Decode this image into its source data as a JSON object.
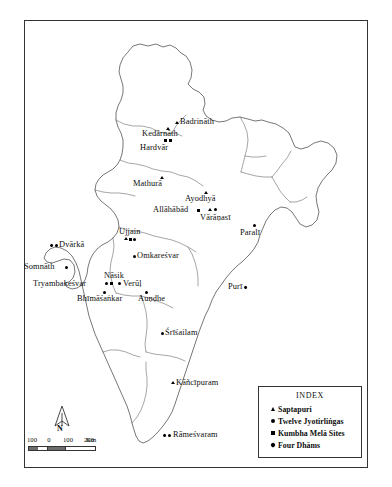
{
  "figure": {
    "kind": "thematic-map",
    "region": "India",
    "background": "#ffffff",
    "outline_color": "#4a4a4a"
  },
  "legend": {
    "title": "INDEX",
    "entries": [
      {
        "symbol": "triangle",
        "label": "Saptapuri"
      },
      {
        "symbol": "circle",
        "label": "Twelve Jyotirliṅgas"
      },
      {
        "symbol": "square",
        "label": "Kumbha Melā Sites"
      },
      {
        "symbol": "diamond",
        "label": "Four Dhāms"
      }
    ]
  },
  "compass": {
    "label": "N"
  },
  "scale": {
    "ticks": [
      "100",
      "0",
      "100",
      "200"
    ],
    "unit": "Km"
  },
  "places": [
    {
      "name": "Badrīnāth",
      "label": "Badrināth"
    },
    {
      "name": "Kedārnāth",
      "label": "Kedārnāth"
    },
    {
      "name": "Hardvār",
      "label": "Hardvār"
    },
    {
      "name": "Mathurā",
      "label": "Mathurā"
    },
    {
      "name": "Ayodhyā",
      "label": "Ayodhyā"
    },
    {
      "name": "Allāhābād",
      "label": "Allāhābād"
    },
    {
      "name": "Vārāṇasī",
      "label": "Vārāṇasī"
    },
    {
      "name": "Paralī",
      "label": "Paralī"
    },
    {
      "name": "Ujjain",
      "label": "Ujjain"
    },
    {
      "name": "Dvārkā",
      "label": "Dvārkā"
    },
    {
      "name": "Omkareśvar",
      "label": "Omkareśvar"
    },
    {
      "name": "Somnāth",
      "label": "Somnāth"
    },
    {
      "name": "Nāsik",
      "label": "Nāsik"
    },
    {
      "name": "Tryambakeśvar",
      "label": "Tryambakeśvar"
    },
    {
      "name": "Verūḷ",
      "label": "Verūḷ"
    },
    {
      "name": "Bhīmāśaṅkar",
      "label": "Bhimāśanikar"
    },
    {
      "name": "Auṇḍhe",
      "label": "Auṇḍhe"
    },
    {
      "name": "Purī",
      "label": "Puri"
    },
    {
      "name": "Śrīśailam",
      "label": "Śrīśailam"
    },
    {
      "name": "Káñcīpuram",
      "label": "Kāñcīpuram"
    },
    {
      "name": "Rāmeśvaram",
      "label": "Rāmeśvaram"
    }
  ],
  "labels": {
    "badrinath": "Badrināth",
    "kedarnath": "Kedārnāth",
    "hardvar": "Hardvār",
    "mathura": "Mathurā",
    "ayodhya": "Ayodhyā",
    "allahabad": "Allāhābād",
    "varanasi": "Vārāṇasī",
    "parali": "Paralī",
    "ujjain": "Ujjain",
    "dvarka": "Dvārkā",
    "omkaresvar": "Omkareśvar",
    "somnath": "Somnāth",
    "nasik": "Nāsik",
    "tryambakesvar": "Tryambakeśvar",
    "verul": "Verūḷ",
    "bhimasankar": "Bhīmāśaṅkar",
    "aundhe": "Auṇḍhe",
    "puri": "Purī",
    "srisailam": "Śrīśailam",
    "kancipuram": "Kāñcīpuram",
    "ramesvaram": "Rāmeśvaram"
  }
}
